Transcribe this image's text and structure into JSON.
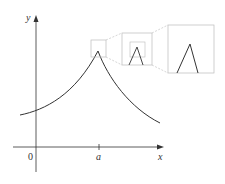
{
  "figure": {
    "type": "function-graph-zoom",
    "axes": {
      "x_label": "x",
      "y_label": "y",
      "origin_label": "0",
      "tick_label": "a"
    },
    "zoom_boxes": 3,
    "colors": {
      "axis": "#333333",
      "curve": "#333333",
      "box": "#bbbbbb"
    }
  }
}
